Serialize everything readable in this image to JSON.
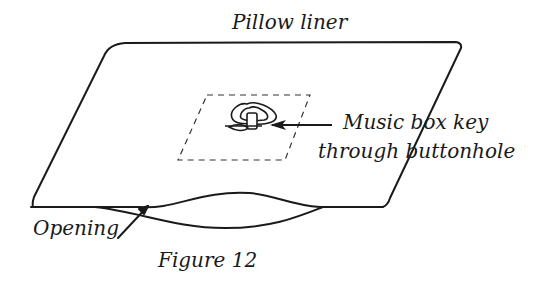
{
  "diagram": {
    "title": "Pillow liner",
    "labels": {
      "key_line1": "Music box key",
      "key_line2": "through buttonhole",
      "opening": "Opening"
    },
    "caption": "Figure 12",
    "colors": {
      "ink": "#1a1a1a",
      "background": "#ffffff"
    }
  }
}
